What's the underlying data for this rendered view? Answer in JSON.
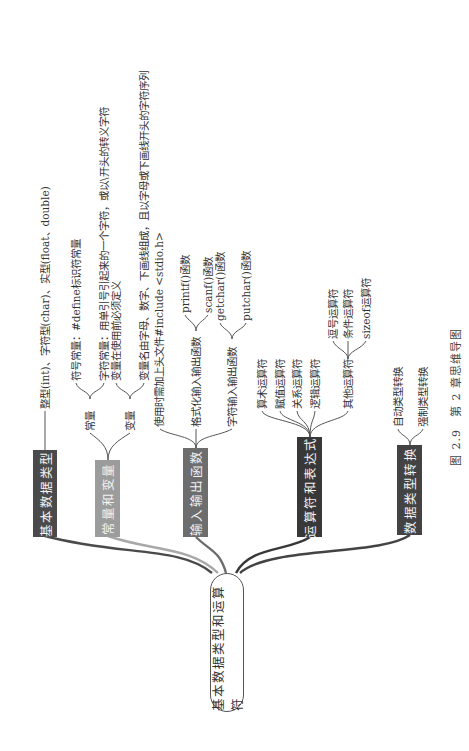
{
  "central_topic": "基本数据类型和运算符",
  "caption": "图 2.9　第 2 章思维导图",
  "colors": {
    "basic_types": "#4a4a4a",
    "constants_variables": "#9c9c9c",
    "io_functions": "#6d6d6d",
    "operators": "#383838",
    "type_conversion": "#434343",
    "center_border": "#555555"
  },
  "branches": [
    {
      "label": "基本数据类型",
      "children": [
        {
          "label": "整型(int)、字符型(char)、实型(float、double)"
        }
      ]
    },
    {
      "label": "常量和变量",
      "children": [
        {
          "label": "常量",
          "children": [
            {
              "label": "符号常量：#define标识符常量"
            },
            {
              "label": "字符常量：用单引号引起来的一个字符，或以\\开头的转义字符"
            }
          ]
        },
        {
          "label": "变量",
          "children": [
            {
              "label": "变量在使用前必须定义"
            },
            {
              "label": "变量名由字母、数字、下画线组成，且以字母或下画线开头的字符序列"
            }
          ]
        }
      ]
    },
    {
      "label": "输入输出函数",
      "children": [
        {
          "label": "使用时需加上头文件#include <stdio.h>"
        },
        {
          "label": "格式化输入输出函数",
          "children": [
            {
              "label": "printf()函数"
            },
            {
              "label": "scanf()函数"
            }
          ]
        },
        {
          "label": "字符输入输出函数",
          "children": [
            {
              "label": "getchar()函数"
            },
            {
              "label": "putchar()函数"
            }
          ]
        }
      ]
    },
    {
      "label": "运算符和表达式",
      "children": [
        {
          "label": "算术运算符"
        },
        {
          "label": "赋值运算符"
        },
        {
          "label": "关系运算符"
        },
        {
          "label": "逻辑运算符"
        },
        {
          "label": "其他运算符",
          "children": [
            {
              "label": "逗号运算符"
            },
            {
              "label": "条件运算符"
            },
            {
              "label": "sizeof运算符"
            }
          ]
        }
      ]
    },
    {
      "label": "数据类型转换",
      "children": [
        {
          "label": "自动类型转换"
        },
        {
          "label": "强制类型转换"
        }
      ]
    }
  ]
}
